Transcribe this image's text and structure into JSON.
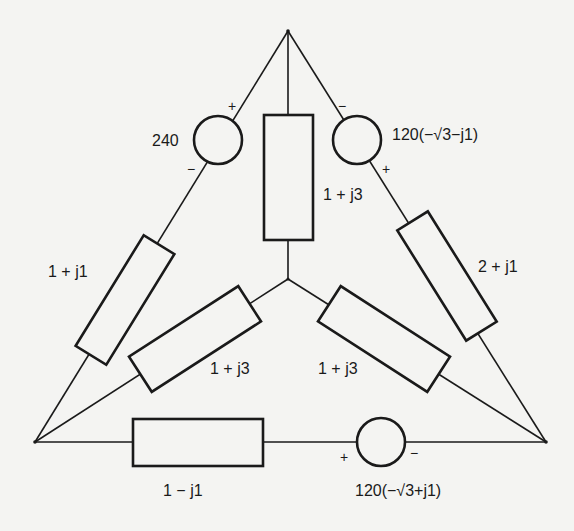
{
  "diagram": {
    "type": "three-phase circuit: delta-connected sources/impedances with wye-connected load",
    "nodes": {
      "top": "top vertex",
      "bottom_left": "bottom-left vertex",
      "bottom_right": "bottom-right vertex",
      "center": "wye neutral node"
    },
    "sources": [
      {
        "id": "src-top-left",
        "label": "240",
        "plus": "+",
        "minus": "−"
      },
      {
        "id": "src-top-right",
        "label": "120(−√3−j1)",
        "plus": "+",
        "minus": "−"
      },
      {
        "id": "src-bottom",
        "label": "120(−√3+j1)",
        "plus": "+",
        "minus": "−"
      }
    ],
    "impedances": [
      {
        "id": "z-left-line",
        "label": "1 + j1"
      },
      {
        "id": "z-right-line",
        "label": "2 + j1"
      },
      {
        "id": "z-bottom-line",
        "label": "1 − j1"
      },
      {
        "id": "z-wye-top",
        "label": "1 + j3"
      },
      {
        "id": "z-wye-left",
        "label": "1 + j3"
      },
      {
        "id": "z-wye-right",
        "label": "1 + j3"
      }
    ]
  }
}
